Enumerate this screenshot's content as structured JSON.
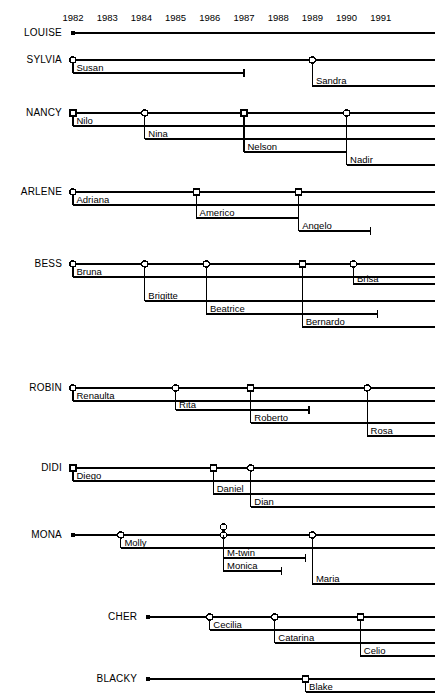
{
  "figure": {
    "type": "timeline-pedigree"
  },
  "axis": {
    "label": "",
    "year_ticks": [
      "1982",
      "1983",
      "1984",
      "1985",
      "1986",
      "1987",
      "1988",
      "1989",
      "1990",
      "1991"
    ],
    "x_start_px": 73,
    "px_per_year": 34.2,
    "left_margin": 60,
    "right_edge": 435
  },
  "legend": {
    "circle_meaning": "female offspring (open circle)",
    "square_meaning": "male offspring (open square)",
    "dot_meaning": "start of observation (filled dot)",
    "tbar_meaning": "death / end of record"
  },
  "chart_data": {
    "type": "timeline",
    "title": "",
    "xlabel": "",
    "ylabel": "",
    "xlim": [
      1981.6,
      1991.6
    ],
    "grid": false,
    "legend_position": "none",
    "mothers": [
      {
        "name": "LOUISE",
        "start": 1982.0,
        "start_marker": "dot",
        "row_y": 33,
        "offspring": []
      },
      {
        "name": "SYLVIA",
        "start": 1982.0,
        "start_marker": "dot",
        "row_y": 60,
        "offspring": [
          {
            "label": "Susan",
            "birth": 1982.0,
            "marker": "circle",
            "end": 1987.0,
            "end_marker": "tbar",
            "dy": 13
          },
          {
            "label": "Sandra",
            "birth": 1989.0,
            "marker": "circle",
            "end": null,
            "end_marker": "open",
            "dy": 26
          }
        ]
      },
      {
        "name": "NANCY",
        "start": 1982.0,
        "start_marker": "dot",
        "row_y": 113,
        "offspring": [
          {
            "label": "Nilo",
            "birth": 1982.0,
            "marker": "square",
            "end": null,
            "end_marker": "open",
            "dy": 13
          },
          {
            "label": "Nina",
            "birth": 1984.1,
            "marker": "circle",
            "end": null,
            "end_marker": "open",
            "dy": 26
          },
          {
            "label": "Nelson",
            "birth": 1987.0,
            "marker": "square",
            "end": 1990.0,
            "end_marker": "tbar",
            "dy": 39
          },
          {
            "label": "Nadir",
            "birth": 1990.0,
            "marker": "circle",
            "end": null,
            "end_marker": "open",
            "dy": 52
          }
        ]
      },
      {
        "name": "ARLENE",
        "start": 1982.0,
        "start_marker": "dot",
        "row_y": 192,
        "offspring": [
          {
            "label": "Adriana",
            "birth": 1982.0,
            "marker": "circle",
            "end": null,
            "end_marker": "open",
            "dy": 13
          },
          {
            "label": "Americo",
            "birth": 1985.6,
            "marker": "square",
            "end": 1988.6,
            "end_marker": "tbar",
            "dy": 26
          },
          {
            "label": "Angelo",
            "birth": 1988.6,
            "marker": "square",
            "end": 1990.7,
            "end_marker": "tbar",
            "dy": 39
          }
        ]
      },
      {
        "name": "BESS",
        "start": 1982.0,
        "start_marker": "dot",
        "row_y": 264,
        "offspring": [
          {
            "label": "Bruna",
            "birth": 1982.0,
            "marker": "circle",
            "end": null,
            "end_marker": "open",
            "dy": 13
          },
          {
            "label": "Brisa",
            "birth": 1990.2,
            "marker": "circle",
            "end": null,
            "end_marker": "open",
            "dy": 20
          },
          {
            "label": "Brigitte",
            "birth": 1984.1,
            "marker": "circle",
            "end": null,
            "end_marker": "open",
            "dy": 37
          },
          {
            "label": "Beatrice",
            "birth": 1985.9,
            "marker": "circle",
            "end": 1990.9,
            "end_marker": "tbar",
            "dy": 50
          },
          {
            "label": "Bernardo",
            "birth": 1988.7,
            "marker": "square",
            "end": null,
            "end_marker": "open",
            "dy": 63
          }
        ]
      },
      {
        "name": "ROBIN",
        "start": 1982.0,
        "start_marker": "dot",
        "row_y": 388,
        "offspring": [
          {
            "label": "Renaulta",
            "birth": 1982.0,
            "marker": "circle",
            "end": null,
            "end_marker": "open",
            "dy": 13
          },
          {
            "label": "Rita",
            "birth": 1985.0,
            "marker": "circle",
            "end": 1988.9,
            "end_marker": "tbar",
            "dy": 22
          },
          {
            "label": "Roberto",
            "birth": 1987.2,
            "marker": "square",
            "end": null,
            "end_marker": "open",
            "dy": 35
          },
          {
            "label": "Rosa",
            "birth": 1990.6,
            "marker": "circle",
            "end": null,
            "end_marker": "open",
            "dy": 48
          }
        ]
      },
      {
        "name": "DIDI",
        "start": 1982.0,
        "start_marker": "dot",
        "row_y": 468,
        "offspring": [
          {
            "label": "Diego",
            "birth": 1982.0,
            "marker": "square",
            "end": null,
            "end_marker": "open",
            "dy": 13
          },
          {
            "label": "Daniel",
            "birth": 1986.1,
            "marker": "square",
            "end": null,
            "end_marker": "open",
            "dy": 26
          },
          {
            "label": "Dian",
            "birth": 1987.2,
            "marker": "circle",
            "end": null,
            "end_marker": "open",
            "dy": 39
          }
        ]
      },
      {
        "name": "MONA",
        "start": 1982.0,
        "start_marker": "dot",
        "row_y": 535,
        "offspring": [
          {
            "label": "Molly",
            "birth": 1983.4,
            "marker": "circle",
            "end": null,
            "end_marker": "open",
            "dy": 13
          },
          {
            "label": "M-twin",
            "birth": 1986.4,
            "marker": "circle-stacked",
            "end": 1988.8,
            "end_marker": "tbar",
            "dy": 23
          },
          {
            "label": "Monica",
            "birth": 1986.4,
            "marker": "none",
            "end": 1988.1,
            "end_marker": "tbar",
            "dy": 36
          },
          {
            "label": "Maria",
            "birth": 1989.0,
            "marker": "circle",
            "end": null,
            "end_marker": "open",
            "dy": 49
          }
        ]
      },
      {
        "name": "CHER",
        "start": 1984.2,
        "start_marker": "dot",
        "row_y": 617,
        "offspring": [
          {
            "label": "Cecilia",
            "birth": 1986.0,
            "marker": "circle",
            "end": null,
            "end_marker": "open",
            "dy": 13
          },
          {
            "label": "Catarina",
            "birth": 1987.9,
            "marker": "circle",
            "end": null,
            "end_marker": "open",
            "dy": 26
          },
          {
            "label": "Celio",
            "birth": 1990.4,
            "marker": "square",
            "end": null,
            "end_marker": "open",
            "dy": 39
          }
        ]
      },
      {
        "name": "BLACKY",
        "start": 1984.2,
        "start_marker": "dot",
        "row_y": 679,
        "offspring": [
          {
            "label": "Blake",
            "birth": 1988.8,
            "marker": "square",
            "end": null,
            "end_marker": "open",
            "dy": 13
          }
        ]
      }
    ]
  }
}
